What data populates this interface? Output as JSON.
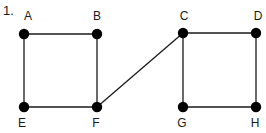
{
  "problem_number": "1.",
  "graph": {
    "node_color": "#000000",
    "edge_color": "#1a1a1a",
    "nodes": [
      {
        "id": "A",
        "label": "A",
        "x": 24,
        "y": 34,
        "label_x": 28,
        "label_y": 20
      },
      {
        "id": "B",
        "label": "B",
        "x": 97,
        "y": 34,
        "label_x": 97,
        "label_y": 20
      },
      {
        "id": "C",
        "label": "C",
        "x": 183,
        "y": 33,
        "label_x": 184,
        "label_y": 20
      },
      {
        "id": "D",
        "label": "D",
        "x": 256,
        "y": 33,
        "label_x": 258,
        "label_y": 20
      },
      {
        "id": "E",
        "label": "E",
        "x": 24,
        "y": 107,
        "label_x": 22,
        "label_y": 127
      },
      {
        "id": "F",
        "label": "F",
        "x": 97,
        "y": 107,
        "label_x": 96,
        "label_y": 127
      },
      {
        "id": "G",
        "label": "G",
        "x": 183,
        "y": 107,
        "label_x": 182,
        "label_y": 127
      },
      {
        "id": "H",
        "label": "H",
        "x": 256,
        "y": 107,
        "label_x": 255,
        "label_y": 127
      }
    ],
    "edges": [
      {
        "from": "A",
        "to": "B"
      },
      {
        "from": "A",
        "to": "E"
      },
      {
        "from": "B",
        "to": "F"
      },
      {
        "from": "E",
        "to": "F"
      },
      {
        "from": "F",
        "to": "C"
      },
      {
        "from": "C",
        "to": "D"
      },
      {
        "from": "C",
        "to": "G"
      },
      {
        "from": "D",
        "to": "H"
      },
      {
        "from": "G",
        "to": "H"
      }
    ]
  }
}
